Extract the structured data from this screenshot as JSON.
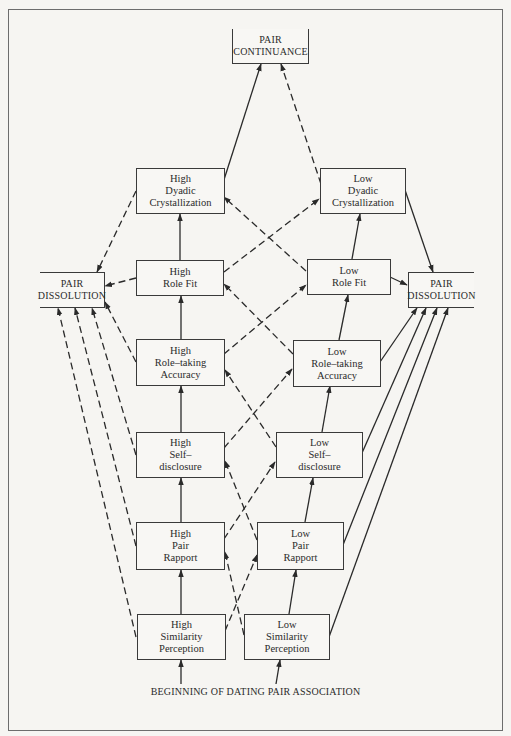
{
  "diagram": {
    "type": "flow-diagram",
    "terminals": {
      "continuance": {
        "lines": [
          "PAIR",
          "CONTINUANCE"
        ]
      },
      "dissolution_left": {
        "lines": [
          "PAIR",
          "DISSOLUTION"
        ]
      },
      "dissolution_right": {
        "lines": [
          "PAIR",
          "DISSOLUTION"
        ]
      }
    },
    "high_column": {
      "dyadic": {
        "lines": [
          "High",
          "Dyadic",
          "Crystallization"
        ]
      },
      "role_fit": {
        "lines": [
          "High",
          "Role Fit"
        ]
      },
      "role_taking": {
        "lines": [
          "High",
          "Role–taking",
          "Accuracy"
        ]
      },
      "self_disclosure": {
        "lines": [
          "High",
          "Self–",
          "disclosure"
        ]
      },
      "pair_rapport": {
        "lines": [
          "High",
          "Pair",
          "Rapport"
        ]
      },
      "similarity": {
        "lines": [
          "High",
          "Similarity",
          "Perception"
        ]
      }
    },
    "low_column": {
      "dyadic": {
        "lines": [
          "Low",
          "Dyadic",
          "Crystallization"
        ]
      },
      "role_fit": {
        "lines": [
          "Low",
          "Role Fit"
        ]
      },
      "role_taking": {
        "lines": [
          "Low",
          "Role–taking",
          "Accuracy"
        ]
      },
      "self_disclosure": {
        "lines": [
          "Low",
          "Self–",
          "disclosure"
        ]
      },
      "pair_rapport": {
        "lines": [
          "Low",
          "Pair",
          "Rapport"
        ]
      },
      "similarity": {
        "lines": [
          "Low",
          "Similarity",
          "Perception"
        ]
      }
    },
    "start_label": "BEGINNING OF DATING PAIR ASSOCIATION",
    "edge_styles": {
      "solid": "favorable/expected path",
      "dashed": "alternate path"
    },
    "colors": {
      "line": "#2a2a2a",
      "frame": "#6d6d6d",
      "background": "#f6f5f2"
    },
    "edges": [
      {
        "from": "start",
        "to": "high.similarity",
        "style": "solid"
      },
      {
        "from": "start",
        "to": "low.similarity",
        "style": "solid"
      },
      {
        "from": "high.similarity",
        "to": "high.pair_rapport",
        "style": "solid"
      },
      {
        "from": "high.similarity",
        "to": "low.pair_rapport",
        "style": "dashed"
      },
      {
        "from": "high.similarity",
        "to": "dissolution_left",
        "style": "dashed"
      },
      {
        "from": "low.similarity",
        "to": "low.pair_rapport",
        "style": "solid"
      },
      {
        "from": "low.similarity",
        "to": "high.pair_rapport",
        "style": "dashed"
      },
      {
        "from": "low.similarity",
        "to": "dissolution_right",
        "style": "solid"
      },
      {
        "from": "high.pair_rapport",
        "to": "high.self_disclosure",
        "style": "solid"
      },
      {
        "from": "high.pair_rapport",
        "to": "low.self_disclosure",
        "style": "dashed"
      },
      {
        "from": "high.pair_rapport",
        "to": "dissolution_left",
        "style": "dashed"
      },
      {
        "from": "low.pair_rapport",
        "to": "low.self_disclosure",
        "style": "solid"
      },
      {
        "from": "low.pair_rapport",
        "to": "high.self_disclosure",
        "style": "dashed"
      },
      {
        "from": "low.pair_rapport",
        "to": "dissolution_right",
        "style": "solid"
      },
      {
        "from": "high.self_disclosure",
        "to": "high.role_taking",
        "style": "solid"
      },
      {
        "from": "high.self_disclosure",
        "to": "low.role_taking",
        "style": "dashed"
      },
      {
        "from": "high.self_disclosure",
        "to": "dissolution_left",
        "style": "dashed"
      },
      {
        "from": "low.self_disclosure",
        "to": "low.role_taking",
        "style": "solid"
      },
      {
        "from": "low.self_disclosure",
        "to": "high.role_taking",
        "style": "dashed"
      },
      {
        "from": "low.self_disclosure",
        "to": "dissolution_right",
        "style": "solid"
      },
      {
        "from": "high.role_taking",
        "to": "high.role_fit",
        "style": "solid"
      },
      {
        "from": "high.role_taking",
        "to": "low.role_fit",
        "style": "dashed"
      },
      {
        "from": "high.role_taking",
        "to": "dissolution_left",
        "style": "dashed"
      },
      {
        "from": "low.role_taking",
        "to": "low.role_fit",
        "style": "solid"
      },
      {
        "from": "low.role_taking",
        "to": "high.role_fit",
        "style": "dashed"
      },
      {
        "from": "low.role_taking",
        "to": "dissolution_right",
        "style": "solid"
      },
      {
        "from": "high.role_fit",
        "to": "high.dyadic",
        "style": "solid"
      },
      {
        "from": "high.role_fit",
        "to": "low.dyadic",
        "style": "dashed"
      },
      {
        "from": "high.role_fit",
        "to": "dissolution_left",
        "style": "dashed"
      },
      {
        "from": "low.role_fit",
        "to": "low.dyadic",
        "style": "solid"
      },
      {
        "from": "low.role_fit",
        "to": "high.dyadic",
        "style": "dashed"
      },
      {
        "from": "low.role_fit",
        "to": "dissolution_right",
        "style": "solid"
      },
      {
        "from": "high.dyadic",
        "to": "continuance",
        "style": "solid"
      },
      {
        "from": "high.dyadic",
        "to": "dissolution_left",
        "style": "dashed"
      },
      {
        "from": "low.dyadic",
        "to": "continuance",
        "style": "dashed"
      },
      {
        "from": "low.dyadic",
        "to": "dissolution_right",
        "style": "solid"
      }
    ]
  }
}
